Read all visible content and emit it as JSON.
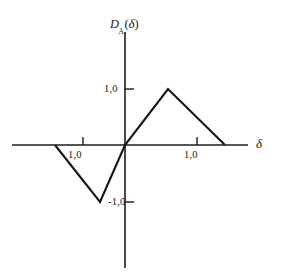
{
  "figure": {
    "background_color": "#ffffff",
    "ink_color": "#1a1a1a"
  },
  "axes": {
    "y_title_main": "D",
    "y_title_subscript": "A",
    "y_title_open_paren": "(",
    "y_title_arg": "δ",
    "y_title_close_paren": ")",
    "x_title": "δ",
    "y_tick_positive": "1,0",
    "y_tick_negative": "-1,0",
    "x_tick_left": "1,0",
    "x_tick_right": "1,0"
  },
  "chart_data": {
    "type": "line",
    "title": "",
    "subtitle": "",
    "xlabel": "δ",
    "ylabel": "D_A(δ)",
    "xlim": [
      -1.57,
      1.71
    ],
    "ylim": [
      -2.0,
      2.0
    ],
    "grid": false,
    "legend": null,
    "decimal_separator": ",",
    "x_ticks": [
      -1.0,
      1.0
    ],
    "x_tick_labels": [
      "1,0",
      "1,0"
    ],
    "y_ticks": [
      -1.0,
      1.0
    ],
    "y_tick_labels": [
      "-1,0",
      "1,0"
    ],
    "series": [
      {
        "name": "D_A(δ)",
        "color": "#141414",
        "line_width": 2.1,
        "x": [
          -1.0,
          -0.6,
          0.0,
          0.6,
          1.4
        ],
        "y": [
          0.0,
          -1.0,
          0.0,
          1.0,
          0.0
        ],
        "description": "Odd-symmetric piecewise-linear discriminator characteristic: zero at δ = -1,0, minimum -1,0 at δ ≈ -0,6, zero crossing at origin, maximum 1,0 at δ ≈ 0,6, returns to zero at δ ≈ 1,4"
      }
    ],
    "annotations": []
  },
  "geometry": {
    "origin_px": [
      125,
      145
    ],
    "x_axis_start_px": [
      12,
      145
    ],
    "x_axis_end_px": [
      248,
      145
    ],
    "y_axis_top_px": [
      125,
      32
    ],
    "y_axis_bottom_px": [
      125,
      268
    ],
    "y_tick_pos_px": [
      125,
      89
    ],
    "y_tick_neg_px": [
      125,
      202
    ],
    "x_tick_left_px": [
      83,
      145
    ],
    "x_tick_right_px": [
      197,
      145
    ],
    "curve_points_px": [
      [
        55,
        145
      ],
      [
        100,
        202
      ],
      [
        125,
        145
      ],
      [
        168,
        89
      ],
      [
        225,
        145
      ]
    ]
  }
}
